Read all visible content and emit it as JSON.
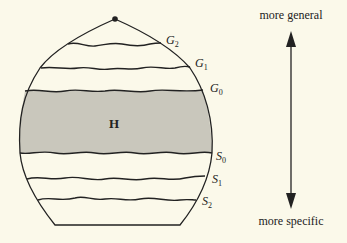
{
  "diagram": {
    "type": "version-space",
    "region_label": "H",
    "general_boundaries": [
      {
        "name": "G",
        "sub": "2"
      },
      {
        "name": "G",
        "sub": "1"
      },
      {
        "name": "G",
        "sub": "0"
      }
    ],
    "specific_boundaries": [
      {
        "name": "S",
        "sub": "0"
      },
      {
        "name": "S",
        "sub": "1"
      },
      {
        "name": "S",
        "sub": "2"
      }
    ],
    "axis": {
      "top_label": "more general",
      "bottom_label": "more specific"
    },
    "colors": {
      "background": "#fbf9ea",
      "shaded_region": "#c9c7bc",
      "stroke": "#222222"
    }
  }
}
